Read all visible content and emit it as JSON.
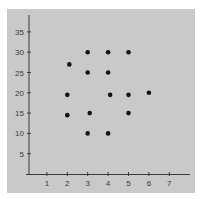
{
  "chart_data": {
    "type": "scatter",
    "title": "",
    "xlabel": "",
    "ylabel": "",
    "xlim": [
      0,
      8
    ],
    "ylim": [
      0,
      38
    ],
    "grid": false,
    "legend": null,
    "x_ticks": [
      1,
      2,
      3,
      4,
      5,
      6,
      7
    ],
    "y_ticks": [
      5,
      10,
      15,
      20,
      25,
      30,
      35
    ],
    "series": [
      {
        "name": "points",
        "points": [
          {
            "x": 3,
            "y": 30
          },
          {
            "x": 4,
            "y": 30
          },
          {
            "x": 5,
            "y": 30
          },
          {
            "x": 2.1,
            "y": 27
          },
          {
            "x": 3,
            "y": 25
          },
          {
            "x": 4,
            "y": 25
          },
          {
            "x": 2,
            "y": 19.5
          },
          {
            "x": 4.1,
            "y": 19.5
          },
          {
            "x": 5,
            "y": 19.5
          },
          {
            "x": 6,
            "y": 20
          },
          {
            "x": 2,
            "y": 14.5
          },
          {
            "x": 3.1,
            "y": 15
          },
          {
            "x": 5,
            "y": 15
          },
          {
            "x": 3,
            "y": 10
          },
          {
            "x": 4,
            "y": 10
          }
        ]
      }
    ]
  },
  "colors": {
    "panel": "#c9c9c9",
    "axis": "#3a3a3a",
    "point": "#141414"
  }
}
